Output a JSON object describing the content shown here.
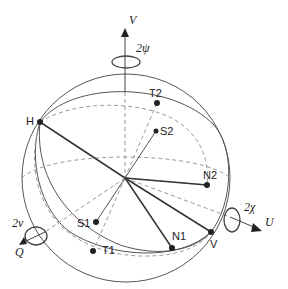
{
  "diagram": {
    "title": "",
    "colors": {
      "line": "#444444",
      "dark_line": "#333333",
      "dashed": "#9a9a9a",
      "point": "#222222",
      "text": "#222222",
      "background": "#ffffff"
    },
    "axes": {
      "vertical": {
        "label": "V",
        "rotation_label": "2ψ"
      },
      "left": {
        "label": "Q",
        "rotation_label": "2ν"
      },
      "right": {
        "label": "U",
        "rotation_label": "2χ"
      }
    },
    "points": [
      {
        "id": "H",
        "label": "H"
      },
      {
        "id": "T2",
        "label": "T2"
      },
      {
        "id": "S2",
        "label": "S2"
      },
      {
        "id": "N2",
        "label": "N2"
      },
      {
        "id": "V",
        "label": "V"
      },
      {
        "id": "N1",
        "label": "N1"
      },
      {
        "id": "S1",
        "label": "S1"
      },
      {
        "id": "T1",
        "label": "T1"
      }
    ]
  }
}
